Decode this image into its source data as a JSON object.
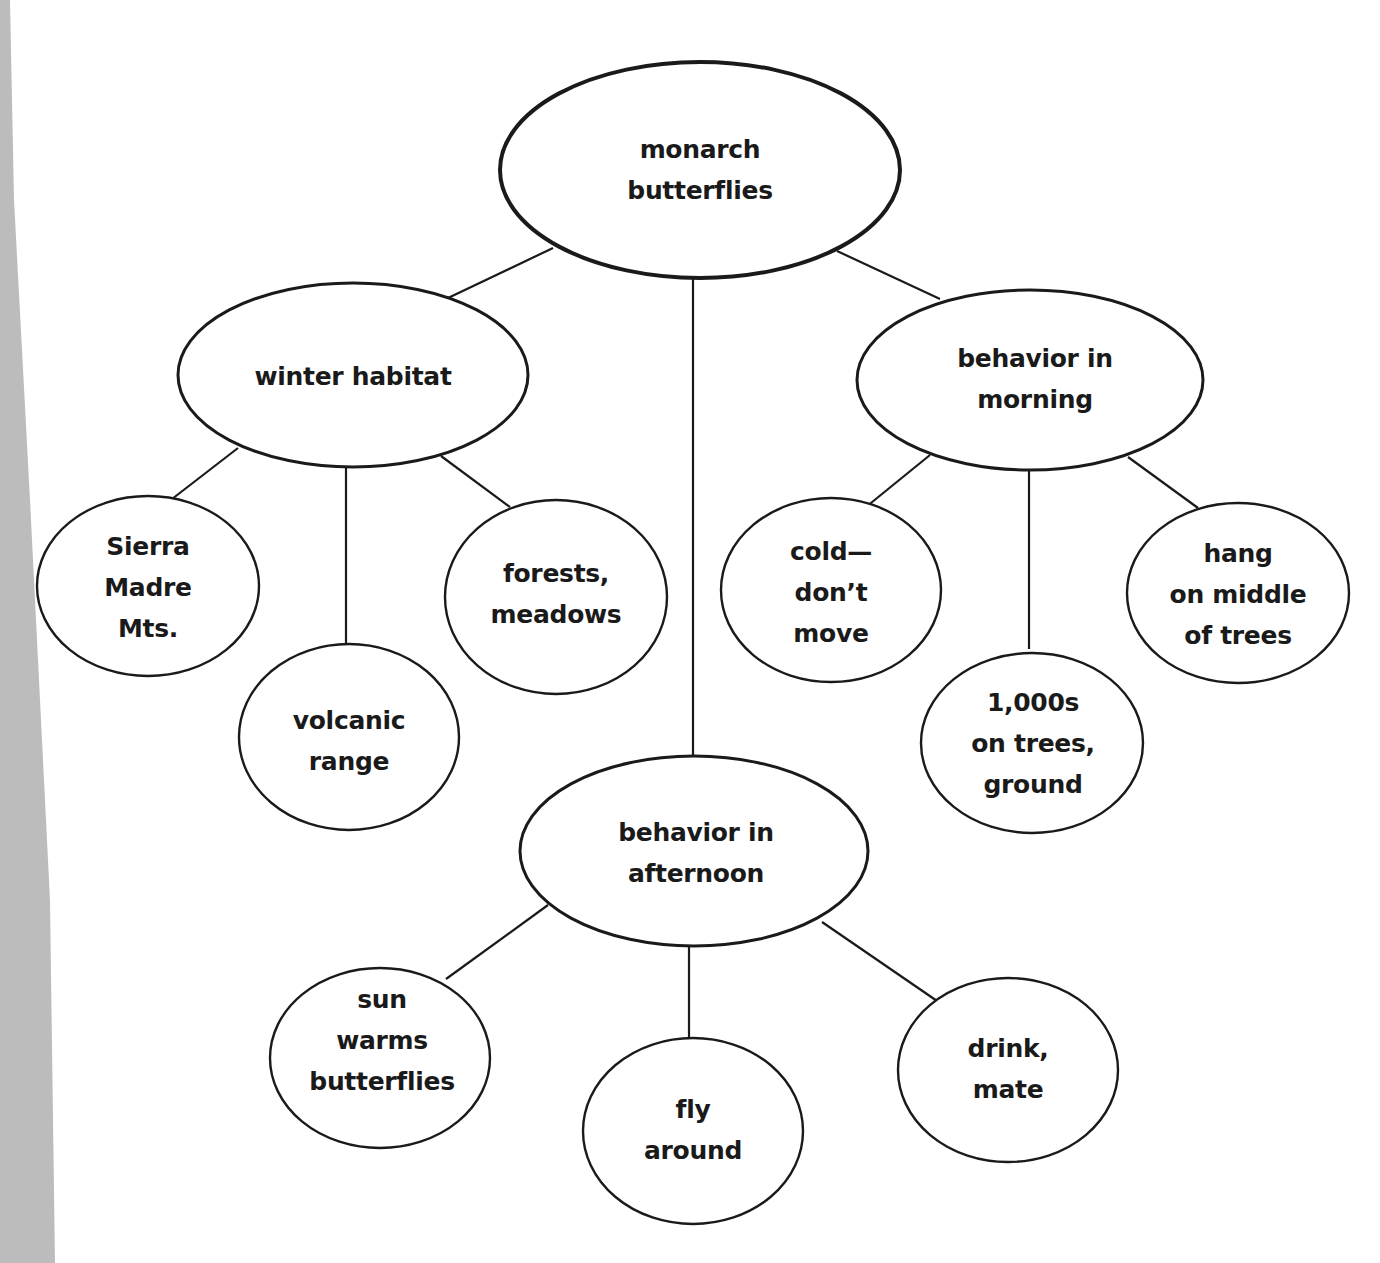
{
  "diagram": {
    "colors": {
      "stroke": "#1a1a1a",
      "text": "#1a1a1a",
      "background": "#ffffff",
      "page_edge": "#bcbcbc"
    },
    "nodes": {
      "root": {
        "lines": [
          "monarch",
          "butterflies"
        ]
      },
      "winter_habitat": {
        "lines": [
          "winter habitat"
        ]
      },
      "behavior_morning": {
        "lines": [
          "behavior in",
          "morning"
        ]
      },
      "behavior_afternoon": {
        "lines": [
          "behavior in",
          "afternoon"
        ]
      },
      "sierra_madre": {
        "lines": [
          "Sierra",
          "Madre",
          "Mts."
        ]
      },
      "volcanic_range": {
        "lines": [
          "volcanic",
          "range"
        ]
      },
      "forests_meadows": {
        "lines": [
          "forests,",
          "meadows"
        ]
      },
      "cold_dont_move": {
        "lines": [
          "cold—",
          "don’t",
          "move"
        ]
      },
      "thousands_on_trees": {
        "lines": [
          "1,000s",
          "on trees,",
          "ground"
        ]
      },
      "hang_on_middle": {
        "lines": [
          "hang",
          "on middle",
          "of trees"
        ]
      },
      "sun_warms": {
        "lines": [
          "sun",
          "warms",
          "butterflies"
        ]
      },
      "fly_around": {
        "lines": [
          "fly",
          "around"
        ]
      },
      "drink_mate": {
        "lines": [
          "drink,",
          "mate"
        ]
      }
    },
    "edges": [
      [
        "root",
        "winter_habitat"
      ],
      [
        "root",
        "behavior_afternoon"
      ],
      [
        "root",
        "behavior_morning"
      ],
      [
        "winter_habitat",
        "sierra_madre"
      ],
      [
        "winter_habitat",
        "volcanic_range"
      ],
      [
        "winter_habitat",
        "forests_meadows"
      ],
      [
        "behavior_morning",
        "cold_dont_move"
      ],
      [
        "behavior_morning",
        "thousands_on_trees"
      ],
      [
        "behavior_morning",
        "hang_on_middle"
      ],
      [
        "behavior_afternoon",
        "sun_warms"
      ],
      [
        "behavior_afternoon",
        "fly_around"
      ],
      [
        "behavior_afternoon",
        "drink_mate"
      ]
    ]
  }
}
